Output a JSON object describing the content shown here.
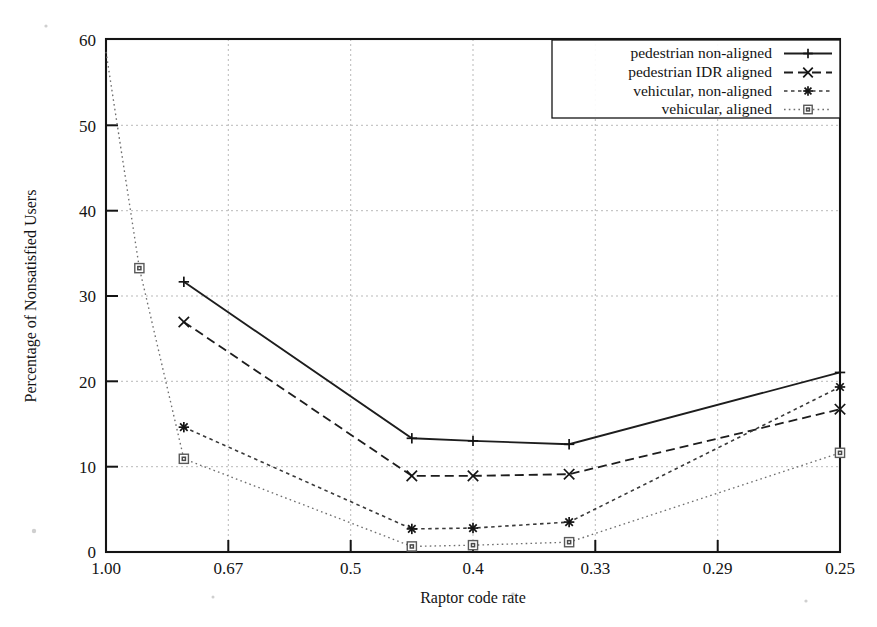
{
  "chart_data": {
    "type": "line",
    "title": "",
    "xlabel": "Raptor code rate",
    "ylabel": "Percentage of Nonsatisfied Users",
    "x_tick_labels": [
      "1.00",
      "0.67",
      "0.5",
      "0.4",
      "0.33",
      "0.29",
      "0.25"
    ],
    "x_tick_values": [
      1.0,
      0.67,
      0.5,
      0.4,
      0.33,
      0.29,
      0.25
    ],
    "y_tick_labels": [
      "0",
      "10",
      "20",
      "30",
      "40",
      "50",
      "60"
    ],
    "y_tick_values": [
      0,
      10,
      20,
      30,
      40,
      50,
      60
    ],
    "ylim": [
      0,
      60
    ],
    "grid": true,
    "legend_position": "top-right",
    "series": [
      {
        "name": "pedestrian non-aligned",
        "marker": "plus",
        "linestyle": "solid",
        "x": [
          0.79,
          0.45,
          0.4,
          0.345,
          0.25
        ],
        "y": [
          31.6,
          13.3,
          13.0,
          12.6,
          21.0
        ]
      },
      {
        "name": "pedestrian IDR aligned",
        "marker": "cross",
        "linestyle": "dashed",
        "x": [
          0.79,
          0.45,
          0.4,
          0.345,
          0.25
        ],
        "y": [
          26.9,
          8.9,
          8.9,
          9.1,
          16.7
        ]
      },
      {
        "name": "vehicular, non-aligned",
        "marker": "star",
        "linestyle": "dotted-dashed",
        "x": [
          0.79,
          0.45,
          0.4,
          0.345,
          0.25
        ],
        "y": [
          14.6,
          2.7,
          2.8,
          3.5,
          19.3
        ]
      },
      {
        "name": "vehicular, aligned",
        "marker": "open-square",
        "linestyle": "fine-dotted",
        "x": [
          1.0,
          0.91,
          0.79,
          0.45,
          0.4,
          0.345,
          0.25
        ],
        "y": [
          58.5,
          33.2,
          10.9,
          0.65,
          0.8,
          1.15,
          11.6
        ]
      }
    ]
  },
  "legend": {
    "items": [
      {
        "label": "pedestrian non-aligned"
      },
      {
        "label": "pedestrian IDR aligned"
      },
      {
        "label": "vehicular, non-aligned"
      },
      {
        "label": "vehicular, aligned"
      }
    ]
  }
}
